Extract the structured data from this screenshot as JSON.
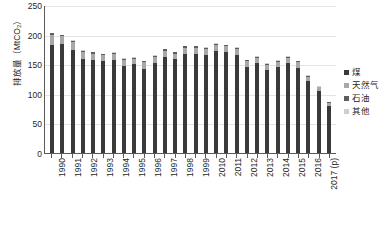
{
  "chart_data": {
    "type": "bar",
    "stacked": true,
    "title": "",
    "xlabel": "",
    "ylabel": "排放量（MtCO₂）",
    "ylim": [
      0,
      250
    ],
    "ytick_labels": [
      "250",
      "200",
      "150",
      "100",
      "50",
      "0"
    ],
    "ytick_values": [
      250,
      200,
      150,
      100,
      50,
      0
    ],
    "grid": true,
    "legend_position": "right",
    "categories": [
      "1990",
      "1991",
      "1992",
      "1993",
      "1994",
      "1995",
      "1996",
      "1997",
      "1998",
      "1999",
      "2000",
      "2001",
      "2002",
      "2003",
      "2004",
      "2005",
      "2006",
      "2007",
      "2008",
      "2009",
      "2010",
      "2011",
      "2012",
      "2013",
      "2014",
      "2015",
      "2016",
      "2017 (p)"
    ],
    "xtick_labels": [
      "1990",
      "1991",
      "1992",
      "1993",
      "1994",
      "1995",
      "1996",
      "1997",
      "1998",
      "1999",
      "2010",
      "2011",
      "2012",
      "2013",
      "2014",
      "2015",
      "2016",
      "2017 (p)"
    ],
    "series": [
      {
        "name": "煤",
        "color": "#3a3a3a",
        "values": [
          183,
          184,
          174,
          158,
          157,
          155,
          157,
          147,
          150,
          142,
          152,
          163,
          158,
          168,
          168,
          166,
          173,
          170,
          166,
          146,
          152,
          140,
          145,
          152,
          144,
          122,
          105,
          80
        ]
      },
      {
        "name": "天然气",
        "color": "#a8a8a8",
        "values": [
          17,
          13,
          14,
          13,
          11,
          10,
          10,
          10,
          9,
          11,
          10,
          10,
          10,
          10,
          10,
          10,
          10,
          10,
          10,
          9,
          9,
          9,
          9,
          9,
          9,
          7,
          6,
          5
        ]
      },
      {
        "name": "石油",
        "color": "#5e5e5e",
        "values": [
          2,
          2,
          2,
          2,
          2,
          2,
          2,
          2,
          2,
          2,
          2,
          2,
          2,
          2,
          2,
          2,
          2,
          2,
          2,
          2,
          2,
          2,
          2,
          2,
          2,
          1,
          1,
          1
        ]
      },
      {
        "name": "其他",
        "color": "#cfcfcf",
        "values": [
          1,
          1,
          1,
          1,
          1,
          1,
          1,
          1,
          1,
          1,
          1,
          1,
          1,
          1,
          1,
          1,
          1,
          1,
          1,
          1,
          1,
          1,
          1,
          1,
          1,
          1,
          1,
          1
        ]
      }
    ],
    "totals": [
      203,
      200,
      191,
      174,
      171,
      168,
      170,
      160,
      162,
      156,
      165,
      176,
      171,
      181,
      181,
      179,
      186,
      183,
      179,
      158,
      164,
      152,
      157,
      164,
      156,
      131,
      113,
      87
    ]
  },
  "legend": {
    "items": [
      {
        "label": "煤",
        "color": "#3a3a3a"
      },
      {
        "label": "天然气",
        "color": "#a8a8a8"
      },
      {
        "label": "石油",
        "color": "#5e5e5e"
      },
      {
        "label": "其他",
        "color": "#cfcfcf"
      }
    ]
  }
}
